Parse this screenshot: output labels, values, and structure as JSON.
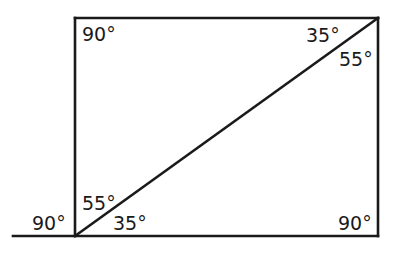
{
  "diagram": {
    "colors": {
      "stroke": "#1a1a1a",
      "background": "#ffffff"
    },
    "labels": {
      "top_left": "90°",
      "top_right_upper": "35°",
      "top_right_lower": "55°",
      "bottom_left_upper": "55°",
      "bottom_left_lower": "35°",
      "bottom_left_exterior": "90°",
      "bottom_right": "90°"
    }
  }
}
